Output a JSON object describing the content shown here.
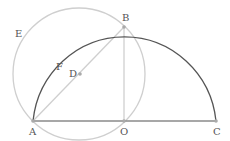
{
  "diagram": {
    "points": {
      "A": {
        "label": "A",
        "x": 33,
        "y": 121
      },
      "B": {
        "label": "B",
        "x": 124,
        "y": 27
      },
      "O": {
        "label": "O",
        "x": 124,
        "y": 121
      },
      "C": {
        "label": "C",
        "x": 216,
        "y": 121
      },
      "D": {
        "label": "D",
        "x": 79,
        "y": 74
      },
      "E": {
        "label": "E"
      },
      "F": {
        "label": "F"
      }
    },
    "colors": {
      "main_arc": "#555555",
      "aux": "#c8c8c8",
      "base": "#8a8a8a",
      "point": "#aaaaaa"
    }
  }
}
